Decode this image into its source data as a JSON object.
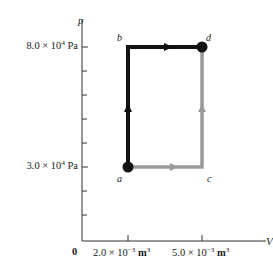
{
  "diagram": {
    "type": "pV-diagram",
    "axes": {
      "y_axis_label": "p",
      "x_axis_label": "V",
      "origin_label": "0",
      "y_tick_labels": [
        {
          "mantissa": "8.0 × 10",
          "exp": "4",
          "unit": "Pa",
          "value": 80000
        },
        {
          "mantissa": "3.0 × 10",
          "exp": "4",
          "unit": "Pa",
          "value": 30000
        }
      ],
      "x_tick_labels": [
        {
          "mantissa": "2.0 × 10",
          "exp": "−3",
          "unit": "m",
          "unit_exp": "3",
          "value": 0.002
        },
        {
          "mantissa": "5.0 × 10",
          "exp": "−3",
          "unit": "m",
          "unit_exp": "3",
          "value": 0.005
        }
      ]
    },
    "points": [
      {
        "name": "a",
        "V": 0.002,
        "p": 30000,
        "marker": true
      },
      {
        "name": "b",
        "V": 0.002,
        "p": 80000,
        "marker": false
      },
      {
        "name": "c",
        "V": 0.005,
        "p": 30000,
        "marker": false
      },
      {
        "name": "d",
        "V": 0.005,
        "p": 80000,
        "marker": true
      }
    ],
    "paths": [
      {
        "name": "path-a-b-d",
        "segments": [
          "a→b",
          "b→d"
        ],
        "color": "#111111",
        "description": "isochoric rise then isobaric expansion"
      },
      {
        "name": "path-a-c-d",
        "segments": [
          "a→c",
          "c→d"
        ],
        "color": "#9a9a9a",
        "description": "isobaric expansion then isochoric rise"
      }
    ],
    "colors": {
      "dark_path": "#111111",
      "light_path": "#9a9a9a",
      "axis": "#333333"
    }
  }
}
